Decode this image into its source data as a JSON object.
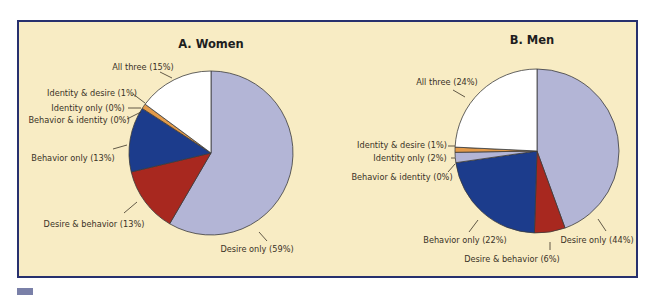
{
  "colors": {
    "panel_bg": "#f8ecc4",
    "panel_border": "#27306e",
    "desire_only": "#b3b5d6",
    "desire_behavior": "#a8281f",
    "behavior_only": "#1c3c8c",
    "behavior_identity": "#b3b5d6",
    "identity_only": "#b3b5d6",
    "identity_desire": "#e39a4a",
    "all_three": "#ffffff"
  },
  "chart_data": [
    {
      "type": "pie",
      "title": "A. Women",
      "categories": [
        "Desire only",
        "Desire & behavior",
        "Behavior only",
        "Behavior & identity",
        "Identity only",
        "Identity & desire",
        "All three"
      ],
      "values": [
        59,
        13,
        13,
        0,
        0,
        1,
        15
      ],
      "labels": [
        "Desire only (59%)",
        "Desire & behavior (13%)",
        "Behavior only (13%)",
        "Behavior & identity (0%)",
        "Identity only (0%)",
        "Identity & desire (1%)",
        "All three (15%)"
      ],
      "start_angle": "12 o'clock, clockwise",
      "legend": "none (direct labels with leader lines)"
    },
    {
      "type": "pie",
      "title": "B. Men",
      "categories": [
        "Desire only",
        "Desire & behavior",
        "Behavior only",
        "Behavior & identity",
        "Identity only",
        "Identity & desire",
        "All three"
      ],
      "values": [
        44,
        6,
        22,
        0,
        2,
        1,
        24
      ],
      "labels": [
        "Desire only (44%)",
        "Desire & behavior (6%)",
        "Behavior only (22%)",
        "Behavior & identity (0%)",
        "Identity only (2%)",
        "Identity & desire (1%)",
        "All three (24%)"
      ],
      "start_angle": "12 o'clock, clockwise",
      "legend": "none (direct labels with leader lines)"
    }
  ]
}
